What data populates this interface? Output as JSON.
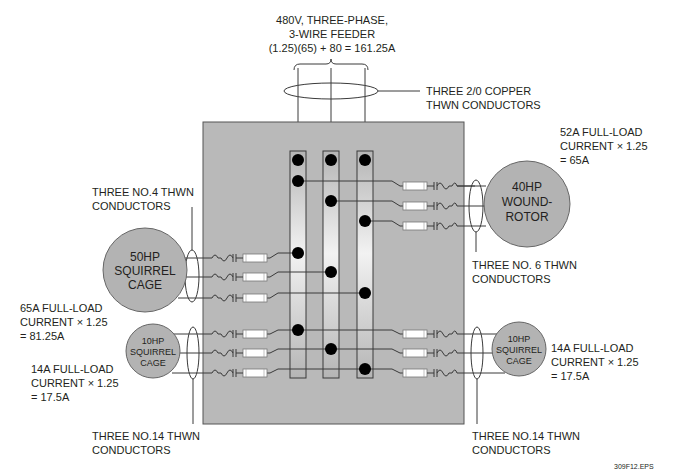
{
  "feeder": {
    "label_lines": [
      "480V, THREE-PHASE,",
      "3-WIRE FEEDER",
      "(1.25)(65) + 80 = 161.25A"
    ],
    "conductor_lines": [
      "THREE 2/0 COPPER",
      "THWN CONDUCTORS"
    ]
  },
  "motors": {
    "wound_rotor_40hp": {
      "name_lines": [
        "40HP",
        "WOUND-",
        "ROTOR"
      ],
      "calc_lines": [
        "52A FULL-LOAD",
        "CURRENT × 1.25",
        "= 65A"
      ],
      "conductor_lines": [
        "THREE NO. 6 THWN",
        "CONDUCTORS"
      ]
    },
    "squirrel_cage_50hp": {
      "name_lines": [
        "50HP",
        "SQUIRREL",
        "CAGE"
      ],
      "calc_lines": [
        "65A FULL-LOAD",
        "CURRENT × 1.25",
        "= 81.25A"
      ],
      "conductor_lines": [
        "THREE NO.4 THWN",
        "CONDUCTORS"
      ]
    },
    "squirrel_cage_10hp_left": {
      "name_lines": [
        "10HP",
        "SQUIRREL",
        "CAGE"
      ],
      "calc_lines": [
        "14A FULL-LOAD",
        "CURRENT × 1.25",
        "= 17.5A"
      ],
      "conductor_lines": [
        "THREE NO.14 THWN",
        "CONDUCTORS"
      ]
    },
    "squirrel_cage_10hp_right": {
      "name_lines": [
        "10HP",
        "SQUIRREL",
        "CAGE"
      ],
      "calc_lines": [
        "14A FULL-LOAD",
        "CURRENT × 1.25",
        "= 17.5A"
      ],
      "conductor_lines": [
        "THREE NO.14 THWN",
        "CONDUCTORS"
      ]
    }
  },
  "figure_id": "309F12.EPS",
  "colors": {
    "panel": "#b9b9b9",
    "motor": "#b3b3b3",
    "text": "#231f20"
  }
}
